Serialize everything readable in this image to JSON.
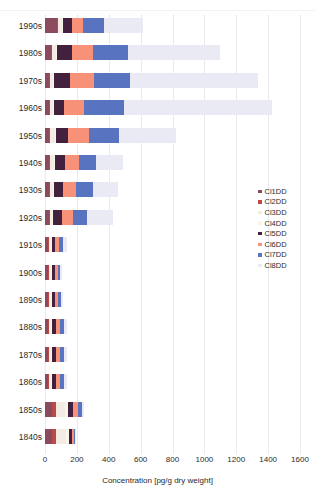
{
  "chart": {
    "type": "bar",
    "orientation": "horizontal",
    "stacked": true,
    "xlabel": "Concentration [pg/g dry weight]",
    "ylabel": "",
    "title": "",
    "xlim": [
      0,
      1600
    ],
    "xticks": [
      0,
      200,
      400,
      600,
      800,
      1000,
      1200,
      1400,
      1600
    ],
    "xtick_labels": [
      "0",
      "200",
      "400",
      "600",
      "800",
      "1000",
      "1200",
      "1400",
      "1600"
    ],
    "grid": true,
    "legend_position": "right"
  },
  "legend": {
    "items": [
      {
        "label": "Cl1DD",
        "color": "#8c4a5e"
      },
      {
        "label": "Cl2DD",
        "color": "#b94a48"
      },
      {
        "label": "Cl3DD",
        "color": "#f2ece4"
      },
      {
        "label": "Cl4DD",
        "color": "#faf5ea"
      },
      {
        "label": "Cl5DD",
        "color": "#42213f"
      },
      {
        "label": "Cl6DD",
        "color": "#f79177"
      },
      {
        "label": "Cl7DD",
        "color": "#5874c0"
      },
      {
        "label": "Cl8DD",
        "color": "#eaeaf4"
      }
    ]
  },
  "chart_data": {
    "type": "bar",
    "orientation": "horizontal",
    "stacked": true,
    "title": "",
    "xlabel": "Concentration [pg/g dry weight]",
    "ylabel": "",
    "xlim": [
      0,
      1600
    ],
    "xticks": [
      0,
      200,
      400,
      600,
      800,
      1000,
      1200,
      1400,
      1600
    ],
    "grid": true,
    "legend_position": "right",
    "categories": [
      "1990s",
      "1980s",
      "1970s",
      "1960s",
      "1950s",
      "1940s",
      "1930s",
      "1920s",
      "1910s",
      "1900s",
      "1890s",
      "1880s",
      "1870s",
      "1860s",
      "1850s",
      "1840s"
    ],
    "series": [
      {
        "name": "Cl1DD",
        "color": "#8c4a5e",
        "values": [
          75,
          38,
          25,
          25,
          25,
          25,
          25,
          25,
          19,
          19,
          19,
          19,
          19,
          19,
          44,
          44
        ]
      },
      {
        "name": "Cl2DD",
        "color": "#b94a48",
        "values": [
          6,
          6,
          6,
          6,
          6,
          6,
          6,
          6,
          6,
          6,
          6,
          6,
          6,
          6,
          25,
          25
        ]
      },
      {
        "name": "Cl3DD",
        "color": "#f2ece4",
        "values": [
          25,
          25,
          19,
          19,
          32,
          25,
          19,
          13,
          13,
          13,
          13,
          13,
          13,
          13,
          57,
          63
        ]
      },
      {
        "name": "Cl4DD",
        "color": "#faf5ea",
        "values": [
          6,
          6,
          6,
          6,
          6,
          6,
          6,
          6,
          6,
          6,
          6,
          6,
          6,
          6,
          19,
          19
        ]
      },
      {
        "name": "Cl5DD",
        "color": "#42213f",
        "values": [
          57,
          94,
          100,
          63,
          75,
          63,
          57,
          57,
          19,
          19,
          19,
          25,
          25,
          25,
          31,
          19
        ]
      },
      {
        "name": "Cl6DD",
        "color": "#f79177",
        "values": [
          69,
          132,
          151,
          126,
          132,
          88,
          82,
          69,
          25,
          19,
          19,
          25,
          25,
          25,
          31,
          13
        ]
      },
      {
        "name": "Cl7DD",
        "color": "#5874c0",
        "values": [
          132,
          220,
          226,
          251,
          189,
          107,
          107,
          88,
          25,
          13,
          19,
          25,
          25,
          25,
          25,
          6
        ]
      },
      {
        "name": "Cl8DD",
        "color": "#eaeaf4",
        "values": [
          245,
          579,
          805,
          930,
          358,
          170,
          157,
          163,
          25,
          13,
          13,
          19,
          19,
          19,
          13,
          6
        ]
      }
    ],
    "totals": [
      615,
      1100,
      1338,
      1426,
      823,
      490,
      459,
      427,
      138,
      108,
      114,
      138,
      138,
      138,
      245,
      195
    ]
  }
}
